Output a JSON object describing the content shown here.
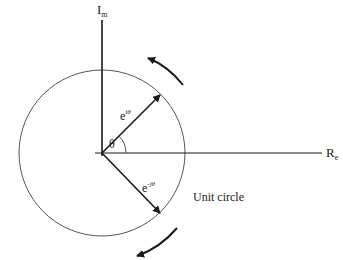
{
  "diagram": {
    "axes": {
      "imag_label_main": "I",
      "imag_label_sub": "m",
      "real_label_main": "R",
      "real_label_sub": "e"
    },
    "vectors": {
      "upper_base": "e",
      "upper_exp": "iθ",
      "lower_base": "e",
      "lower_exp": "-jθ"
    },
    "angle_label": "θ",
    "circle_label": "Unit circle",
    "rotation_arrows": [
      "counter-clockwise (upper)",
      "clockwise (lower)"
    ],
    "colors": {
      "lines": "#1a1a1a",
      "circle": "#555555",
      "background": "#ffffff"
    }
  }
}
